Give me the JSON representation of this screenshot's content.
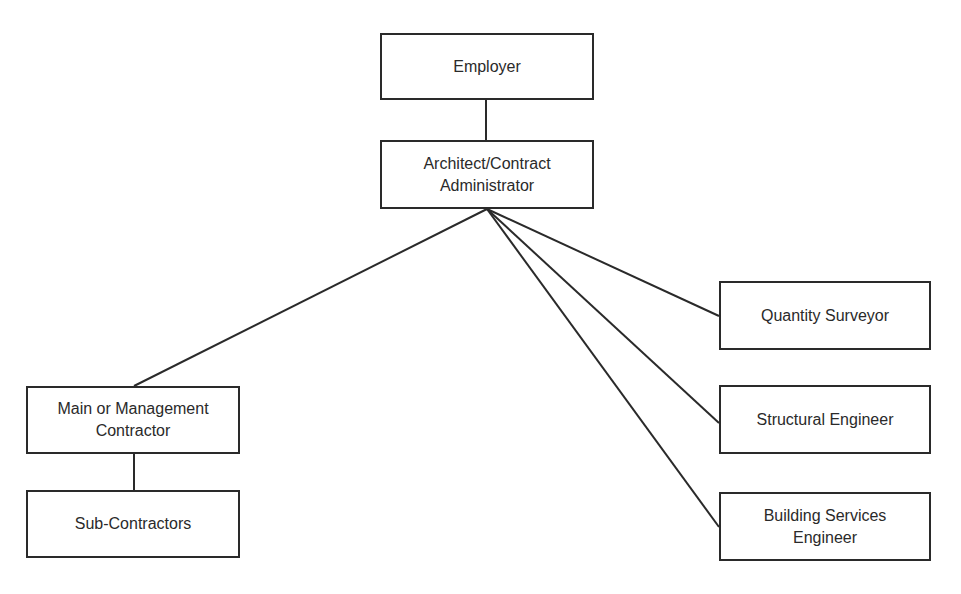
{
  "diagram": {
    "type": "organisation-chart",
    "nodes": [
      {
        "id": "employer",
        "label": "Employer",
        "x": 380,
        "y": 33,
        "w": 214,
        "h": 67
      },
      {
        "id": "architect",
        "label": "Architect/Contract\nAdministrator",
        "x": 380,
        "y": 140,
        "w": 214,
        "h": 69
      },
      {
        "id": "main-contractor",
        "label": "Main or Management\nContractor",
        "x": 26,
        "y": 386,
        "w": 214,
        "h": 68
      },
      {
        "id": "sub-contractors",
        "label": "Sub-Contractors",
        "x": 26,
        "y": 490,
        "w": 214,
        "h": 68
      },
      {
        "id": "quantity-surveyor",
        "label": "Quantity Surveyor",
        "x": 719,
        "y": 281,
        "w": 212,
        "h": 69
      },
      {
        "id": "structural-engineer",
        "label": "Structural Engineer",
        "x": 719,
        "y": 385,
        "w": 212,
        "h": 69
      },
      {
        "id": "building-services-engineer",
        "label": "Building Services\nEngineer",
        "x": 719,
        "y": 492,
        "w": 212,
        "h": 69
      }
    ],
    "edges": [
      {
        "from": "employer",
        "to": "architect",
        "x1": 486,
        "y1": 100,
        "x2": 486,
        "y2": 140
      },
      {
        "from": "architect",
        "to": "main-contractor",
        "x1": 487,
        "y1": 209,
        "x2": 134,
        "y2": 386
      },
      {
        "from": "architect",
        "to": "quantity-surveyor",
        "x1": 487,
        "y1": 209,
        "x2": 719,
        "y2": 316
      },
      {
        "from": "architect",
        "to": "structural-engineer",
        "x1": 487,
        "y1": 209,
        "x2": 719,
        "y2": 423
      },
      {
        "from": "architect",
        "to": "building-services-engineer",
        "x1": 487,
        "y1": 209,
        "x2": 719,
        "y2": 527
      },
      {
        "from": "main-contractor",
        "to": "sub-contractors",
        "x1": 134,
        "y1": 454,
        "x2": 134,
        "y2": 490
      }
    ]
  }
}
